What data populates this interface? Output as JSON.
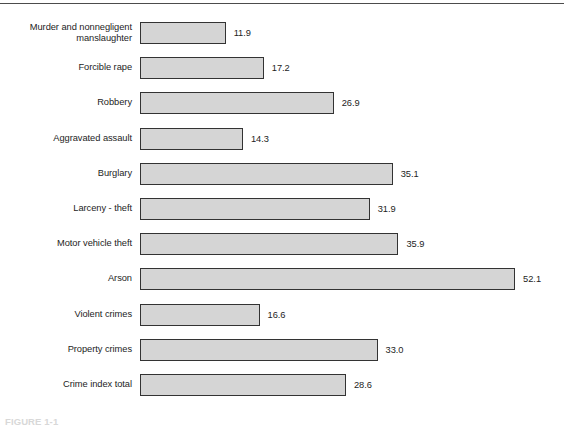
{
  "figure": {
    "caption": "FIGURE 1-1",
    "rule_color": "#4c4c4c",
    "background": "#ffffff"
  },
  "chart_data": {
    "type": "bar",
    "orientation": "horizontal",
    "title": "",
    "subtitle": "",
    "xlabel": "",
    "ylabel": "",
    "grid": false,
    "legend": null,
    "xlim": [
      0,
      52.1
    ],
    "bar_fill_color": "#d5d5d5",
    "bar_border_color": "#333333",
    "value_label_format": "one decimal",
    "categories": [
      "Murder and nonnegligent\nmanslaughter",
      "Forcible rape",
      "Robbery",
      "Aggravated assault",
      "Burglary",
      "Larceny - theft",
      "Motor vehicle theft",
      "Arson",
      "Violent crimes",
      "Property crimes",
      "Crime index total"
    ],
    "values": [
      11.9,
      17.2,
      26.9,
      14.3,
      35.1,
      31.9,
      35.9,
      52.1,
      16.6,
      33.0,
      28.6
    ],
    "value_labels": [
      "11.9",
      "17.2",
      "26.9",
      "14.3",
      "35.1",
      "31.9",
      "35.9",
      "52.1",
      "16.6",
      "33.0",
      "28.6"
    ]
  }
}
